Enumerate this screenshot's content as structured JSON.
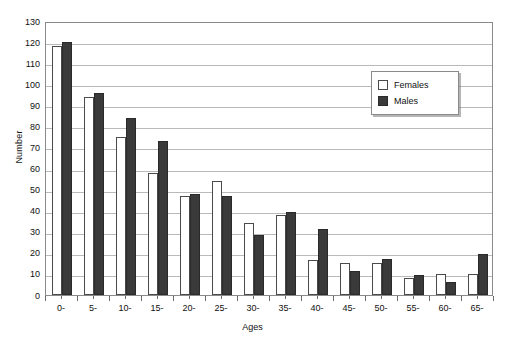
{
  "chart_data": {
    "type": "bar",
    "title": "",
    "xlabel": "Ages",
    "ylabel": "Number",
    "categories": [
      "0-",
      "5-",
      "10-",
      "15-",
      "20-",
      "25-",
      "30-",
      "35-",
      "40-",
      "45-",
      "50-",
      "55-",
      "60-",
      "65-"
    ],
    "series": [
      {
        "name": "Females",
        "color": "#ffffff",
        "values": [
          118,
          94,
          75,
          58,
          47,
          54,
          34,
          38,
          16.5,
          15,
          15,
          8,
          10,
          10
        ]
      },
      {
        "name": "Males",
        "color": "#3a3a3a",
        "values": [
          120,
          96,
          84,
          73,
          48,
          47,
          28.5,
          39.5,
          31.5,
          11.5,
          17,
          9.3,
          6,
          19.5
        ]
      }
    ],
    "ylim": [
      0,
      130
    ],
    "ytick_step": 10,
    "yticks": [
      130,
      120,
      110,
      100,
      90,
      80,
      70,
      60,
      50,
      40,
      30,
      20,
      10,
      0
    ],
    "ytick_labels": [
      "130",
      "120",
      "110",
      "100",
      "90",
      "80",
      "70",
      "60",
      "50",
      "40",
      "30",
      "20",
      "10",
      "0"
    ],
    "grid": true,
    "legend_position": "top-right",
    "legend_entries": [
      "Females",
      "Males"
    ]
  }
}
